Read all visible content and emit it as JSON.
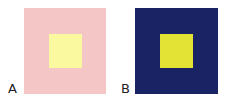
{
  "panels": [
    {
      "label": "A",
      "outer_color": "#f5c6c6",
      "inner_color": "#fbf9a0"
    },
    {
      "label": "B",
      "outer_color": "#1a2464",
      "inner_color": "#e3e335"
    }
  ]
}
